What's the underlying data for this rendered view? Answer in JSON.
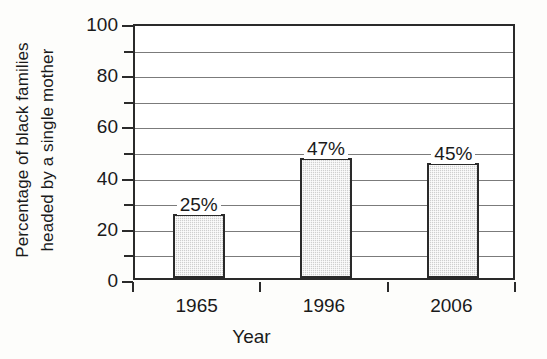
{
  "chart_data": {
    "type": "bar",
    "title": "",
    "subtitle": "",
    "xlabel": "Year",
    "ylabel": "Percentage of black families headed by a single mother",
    "ylabel_lines": [
      "Percentage of black families",
      "headed by a single mother"
    ],
    "categories": [
      "1965",
      "1996",
      "2006"
    ],
    "values": [
      25,
      47,
      45
    ],
    "data_labels": [
      "25%",
      "47%",
      "45%"
    ],
    "ylim": [
      0,
      100
    ],
    "ytick_labels": [
      "0",
      "20",
      "40",
      "60",
      "80",
      "100"
    ],
    "ytick_values": [
      0,
      20,
      40,
      60,
      80,
      100
    ],
    "minor_tick_values": [
      10,
      30,
      50,
      70,
      90
    ],
    "gridline_values": [
      10,
      20,
      30,
      40,
      50,
      60,
      70,
      80,
      90,
      100
    ],
    "grid": true,
    "legend": null,
    "series": [
      {
        "name": "Percentage of black families headed by a single mother",
        "values": [
          25,
          47,
          45
        ]
      }
    ],
    "colors": {
      "bar_fill": "#cfcfcf",
      "bar_edge": "#2a2a2a",
      "gridline": "#7b7b7b",
      "axis": "#2a2a2a",
      "plot_background": "#ffffff",
      "figure_background": "#fdfdfb",
      "text": "#1a1a1a"
    }
  }
}
